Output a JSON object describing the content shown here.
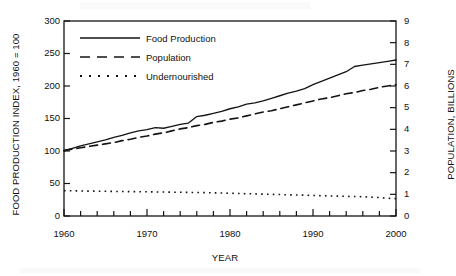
{
  "chart_data": {
    "type": "line",
    "title": "",
    "xlabel": "YEAR",
    "ylabel": "FOOD PRODUCTION INDEX, 1960 = 100",
    "ylabel_right": "POPULATION, BILLIONS",
    "xlim": [
      1960,
      2000
    ],
    "ylim": [
      0,
      300
    ],
    "ylim_right": [
      0,
      9
    ],
    "grid": false,
    "legend_position": "upper-left-inside",
    "x_ticks_major": [
      1960,
      1970,
      1980,
      1990,
      2000
    ],
    "x_tick_labels": [
      "1960",
      "1970",
      "1980",
      "1990",
      "2000"
    ],
    "x_minor_tick_step": 2,
    "y_ticks_left": [
      0,
      50,
      100,
      150,
      200,
      250,
      300
    ],
    "y_tick_labels_left": [
      "0",
      "50",
      "100",
      "150",
      "200",
      "250",
      "300"
    ],
    "y_ticks_right": [
      0,
      1,
      2,
      3,
      4,
      5,
      6,
      7,
      8,
      9
    ],
    "y_tick_labels_right": [
      "0",
      "1",
      "2",
      "3",
      "4",
      "5",
      "6",
      "7",
      "8",
      "9"
    ],
    "x": [
      1960,
      1961,
      1962,
      1963,
      1964,
      1965,
      1966,
      1967,
      1968,
      1969,
      1970,
      1971,
      1972,
      1973,
      1974,
      1975,
      1976,
      1977,
      1978,
      1979,
      1980,
      1981,
      1982,
      1983,
      1984,
      1985,
      1986,
      1987,
      1988,
      1989,
      1990,
      1991,
      1992,
      1993,
      1994,
      1995,
      1996,
      1997,
      1998,
      1999,
      2000
    ],
    "series": [
      {
        "name": "Food Production",
        "style": "solid",
        "axis": "left",
        "units": "index, 1960 = 100",
        "values": [
          100,
          104,
          108,
          111,
          114,
          117,
          121,
          124,
          128,
          131,
          133,
          136,
          135,
          138,
          141,
          143,
          153,
          155,
          158,
          161,
          165,
          168,
          172,
          174,
          177,
          181,
          185,
          189,
          192,
          196,
          202,
          207,
          212,
          217,
          222,
          230,
          232,
          234,
          236,
          238,
          240
        ]
      },
      {
        "name": "Population",
        "style": "dashed",
        "axis": "right",
        "units": "billions",
        "values": [
          3.03,
          3.08,
          3.14,
          3.2,
          3.27,
          3.33,
          3.4,
          3.47,
          3.55,
          3.62,
          3.7,
          3.78,
          3.85,
          3.93,
          4.01,
          4.08,
          4.16,
          4.23,
          4.31,
          4.39,
          4.46,
          4.54,
          4.62,
          4.71,
          4.79,
          4.87,
          4.96,
          5.05,
          5.14,
          5.22,
          5.31,
          5.39,
          5.47,
          5.55,
          5.63,
          5.71,
          5.79,
          5.86,
          5.93,
          6.0,
          6.06
        ],
        "values_left_scale": [
          101,
          103,
          105,
          107,
          109,
          111,
          113,
          116,
          118,
          121,
          123,
          126,
          128,
          131,
          134,
          136,
          139,
          141,
          144,
          146,
          149,
          151,
          154,
          157,
          160,
          162,
          165,
          168,
          171,
          174,
          177,
          180,
          182,
          185,
          188,
          190,
          193,
          195,
          198,
          200,
          202
        ]
      },
      {
        "name": "Undernourished",
        "style": "dotted",
        "axis": "right",
        "units": "billions",
        "values": [
          1.17,
          1.16,
          1.16,
          1.15,
          1.15,
          1.14,
          1.14,
          1.13,
          1.13,
          1.12,
          1.12,
          1.11,
          1.11,
          1.1,
          1.1,
          1.09,
          1.08,
          1.08,
          1.07,
          1.06,
          1.05,
          1.04,
          1.03,
          1.02,
          1.01,
          1.0,
          0.99,
          0.98,
          0.97,
          0.96,
          0.95,
          0.94,
          0.93,
          0.92,
          0.91,
          0.9,
          0.89,
          0.87,
          0.85,
          0.82,
          0.8
        ],
        "values_left_scale": [
          39,
          38.8,
          38.5,
          38.3,
          38.2,
          38,
          37.8,
          37.7,
          37.5,
          37.4,
          37.2,
          37,
          36.9,
          36.7,
          36.5,
          36.3,
          36.1,
          35.9,
          35.6,
          35.4,
          35,
          34.6,
          34.3,
          34,
          33.6,
          33.3,
          33,
          32.6,
          32.3,
          32,
          31.6,
          31.2,
          30.9,
          30.6,
          30.2,
          30,
          29.6,
          29,
          28.3,
          27.4,
          26.7
        ]
      }
    ],
    "legend": [
      {
        "label": "Food Production",
        "style": "solid"
      },
      {
        "label": "Population",
        "style": "dashed"
      },
      {
        "label": "Undernourished",
        "style": "dotted"
      }
    ],
    "colors": {
      "line": "#141414",
      "axis": "#141414",
      "background": "#ffffff"
    }
  }
}
